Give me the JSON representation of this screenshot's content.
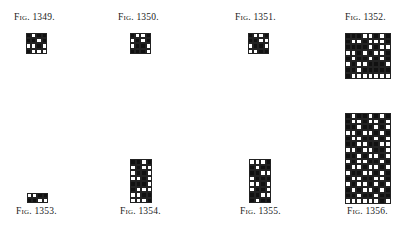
{
  "figures": [
    {
      "id": "1349",
      "label": "Fig. 1349.",
      "label_pos": {
        "x": 14,
        "y": 12
      },
      "grid_pos": {
        "x": 26,
        "y": 33
      },
      "cell": 5.2,
      "cols": 4,
      "rows": [
        "BWBB",
        "BBWB",
        "WWBW",
        "BWWW"
      ]
    },
    {
      "id": "1350",
      "label": "Fig. 1350.",
      "label_pos": {
        "x": 118,
        "y": 12
      },
      "grid_pos": {
        "x": 130,
        "y": 33
      },
      "cell": 5.2,
      "cols": 4,
      "rows": [
        "BWWB",
        "WBWB",
        "WBBW",
        "BBBW"
      ]
    },
    {
      "id": "1351",
      "label": "Fig. 1351.",
      "label_pos": {
        "x": 235,
        "y": 12
      },
      "grid_pos": {
        "x": 248,
        "y": 33
      },
      "cell": 5.2,
      "cols": 4,
      "rows": [
        "BWWB",
        "BBWW",
        "WBBW",
        "WWBB"
      ]
    },
    {
      "id": "1352",
      "label": "Fig. 1352.",
      "label_pos": {
        "x": 345,
        "y": 12
      },
      "grid_pos": {
        "x": 345,
        "y": 33
      },
      "cell": 5.7,
      "cols": 8,
      "rows": [
        "BBBWWBWB",
        "BWWBWWWB",
        "BBBBWBWW",
        "WWBWBWWB",
        "BWBBWBWB",
        "WBWWBBBW",
        "BBWBBBBB",
        "BWWWWWWW"
      ]
    },
    {
      "id": "1353",
      "label": "Fig. 1353.",
      "label_pos": {
        "x": 16,
        "y": 206
      },
      "grid_pos": {
        "x": 27,
        "y": 193
      },
      "cell": 5.2,
      "cols": 4,
      "rows": [
        "WWBB",
        "BBWW"
      ]
    },
    {
      "id": "1354",
      "label": "Fig. 1354.",
      "label_pos": {
        "x": 120,
        "y": 206
      },
      "grid_pos": {
        "x": 130,
        "y": 159
      },
      "cell": 5.5,
      "cols": 4,
      "rows": [
        "BBWB",
        "WBWW",
        "WBBW",
        "WWBW",
        "BBBW",
        "BWWW",
        "WWBB",
        "WWWB"
      ]
    },
    {
      "id": "1355",
      "label": "Fig. 1355.",
      "label_pos": {
        "x": 240,
        "y": 206
      },
      "grid_pos": {
        "x": 249,
        "y": 159
      },
      "cell": 5.5,
      "cols": 4,
      "rows": [
        "WWWB",
        "BWBB",
        "BBWW",
        "WBBB",
        "WWBW",
        "WBBW",
        "BBWW",
        "BWBB"
      ]
    },
    {
      "id": "1356",
      "label": "Fig. 1356.",
      "label_pos": {
        "x": 347,
        "y": 206
      },
      "grid_pos": {
        "x": 345,
        "y": 113
      },
      "cell": 5.7,
      "cols": 8,
      "rows": [
        "BWBBWBWB",
        "BWWBWWBW",
        "BBWBBWBW",
        "WWBWWBWB",
        "BWWBBWBW",
        "BBWWBBWW",
        "WWBWWBBW",
        "BBWBWWBW",
        "WBWWBBWB",
        "BWWBWWBW",
        "WBBWWBWB",
        "BWWBBWWB",
        "WBWWBWBW",
        "BWBWWBWB",
        "BBWBBWBB",
        "WWWWWWBW"
      ]
    }
  ]
}
